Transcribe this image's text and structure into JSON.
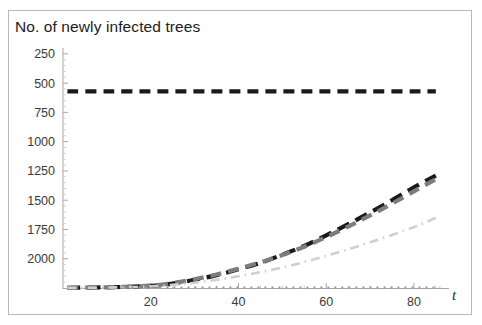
{
  "figure": {
    "title": "No. of newly infected trees",
    "frame_color": "#b9b9b9",
    "background": "#ffffff"
  },
  "axes": {
    "y_ticks": [
      "2000",
      "1750",
      "1500",
      "1250",
      "1000",
      "750",
      "500",
      "250"
    ],
    "x_ticks": [
      "20",
      "40",
      "60",
      "80"
    ],
    "x_axis_label": "t",
    "y_axis_label": "",
    "axis_color": "#a8a8a8"
  },
  "chart_data": {
    "type": "line",
    "title": "No. of newly infected trees",
    "xlabel": "t",
    "ylabel": "No. of newly infected trees",
    "xlim": [
      0,
      88
    ],
    "ylim": [
      0,
      2050
    ],
    "x_ticks": [
      20,
      40,
      60,
      80
    ],
    "y_ticks": [
      250,
      500,
      750,
      1000,
      1250,
      1500,
      1750,
      2000
    ],
    "grid": false,
    "legend": "none",
    "series": [
      {
        "name": "constant-upper-bound",
        "color": "#1a1a1a",
        "dash": "dashed",
        "x": [
          1,
          10,
          20,
          30,
          40,
          50,
          60,
          70,
          80,
          85
        ],
        "values": [
          1680,
          1680,
          1680,
          1680,
          1680,
          1680,
          1680,
          1680,
          1680,
          1680
        ]
      },
      {
        "name": "black-dashed-growth",
        "color": "#1a1a1a",
        "dash": "long-dashed",
        "x": [
          1,
          10,
          20,
          25,
          30,
          35,
          40,
          45,
          50,
          55,
          60,
          65,
          70,
          75,
          80,
          85
        ],
        "values": [
          2,
          6,
          18,
          38,
          70,
          110,
          160,
          215,
          285,
          360,
          450,
          545,
          645,
          750,
          860,
          960
        ]
      },
      {
        "name": "gray-dashed-growth",
        "color": "#7d7d7d",
        "dash": "dashed",
        "x": [
          1,
          10,
          20,
          25,
          30,
          35,
          40,
          45,
          50,
          55,
          60,
          65,
          70,
          75,
          80,
          85
        ],
        "values": [
          2,
          6,
          20,
          42,
          75,
          115,
          165,
          218,
          282,
          352,
          435,
          525,
          620,
          720,
          825,
          930
        ]
      },
      {
        "name": "light-gray-dashdot-growth",
        "color": "#cfcfcf",
        "dash": "dash-dot",
        "x": [
          1,
          10,
          20,
          30,
          40,
          50,
          60,
          70,
          80,
          85
        ],
        "values": [
          1,
          4,
          14,
          45,
          100,
          175,
          275,
          390,
          520,
          600
        ]
      },
      {
        "name": "gray-dotted-baseline",
        "color": "#9a9a9a",
        "dash": "dotted",
        "x": [
          14,
          30,
          45,
          60,
          75,
          86
        ],
        "values": [
          3,
          3,
          3,
          3,
          3,
          3
        ]
      }
    ]
  }
}
